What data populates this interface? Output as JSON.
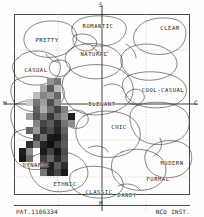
{
  "diagram": {
    "footer_left": "PAT.1106334",
    "footer_center": "H",
    "footer_right": "NCD INST."
  },
  "axes": {
    "top_label": "S",
    "bottom_label": "H",
    "left_label": "W",
    "right_label": "C",
    "x_range": [
      -2,
      2
    ],
    "y_range": [
      -2,
      2
    ],
    "grid": true,
    "grid_color": "#d8b9b9",
    "frame_color": "#4a4a4a"
  },
  "regions": [
    {
      "name": "romantic",
      "label": "ROMANTIC",
      "x": 98,
      "y": 26
    },
    {
      "name": "clear",
      "label": "CLEAR",
      "x": 170,
      "y": 28
    },
    {
      "name": "pretty",
      "label": "PRETTY",
      "x": 47,
      "y": 40
    },
    {
      "name": "natural",
      "label": "NATURAL",
      "x": 94,
      "y": 54
    },
    {
      "name": "casual",
      "label": "CASUAL",
      "x": 36,
      "y": 70
    },
    {
      "name": "cool-casual",
      "label": "COOL-CASUAL",
      "x": 163,
      "y": 90
    },
    {
      "name": "elegant",
      "label": "ELEGANT",
      "x": 102,
      "y": 104
    },
    {
      "name": "chic",
      "label": "CHIC",
      "x": 119,
      "y": 127
    },
    {
      "name": "modern",
      "label": "MODERN",
      "x": 172,
      "y": 163
    },
    {
      "name": "dynamic",
      "label": "DYNAMIC",
      "x": 36,
      "y": 165
    },
    {
      "name": "formal",
      "label": "FORMAL",
      "x": 158,
      "y": 179
    },
    {
      "name": "ethnic",
      "label": "ETHNIC",
      "x": 65,
      "y": 184
    },
    {
      "name": "classic",
      "label": "CLASSIC",
      "x": 99,
      "y": 192
    },
    {
      "name": "dandy",
      "label": "DANDY",
      "x": 127,
      "y": 195
    }
  ],
  "chart_data": {
    "type": "heatmap",
    "xlabel": "W — C",
    "ylabel": "S — H",
    "xlim": [
      -2,
      2
    ],
    "ylim": [
      -2,
      2
    ],
    "cell_size": 7,
    "note": "Grayscale cluster of plotted color samples over the image-scale map",
    "cells": [
      {
        "x": 47,
        "y": 78,
        "v": 0.58
      },
      {
        "x": 54,
        "y": 78,
        "v": 0.47
      },
      {
        "x": 40,
        "y": 85,
        "v": 0.66
      },
      {
        "x": 47,
        "y": 85,
        "v": 0.35
      },
      {
        "x": 54,
        "y": 85,
        "v": 0.72
      },
      {
        "x": 33,
        "y": 92,
        "v": 0.74
      },
      {
        "x": 40,
        "y": 92,
        "v": 0.52
      },
      {
        "x": 47,
        "y": 92,
        "v": 0.6
      },
      {
        "x": 54,
        "y": 92,
        "v": 0.4
      },
      {
        "x": 26,
        "y": 99,
        "v": 0.8
      },
      {
        "x": 33,
        "y": 99,
        "v": 0.45
      },
      {
        "x": 40,
        "y": 99,
        "v": 0.62
      },
      {
        "x": 47,
        "y": 99,
        "v": 0.3
      },
      {
        "x": 54,
        "y": 99,
        "v": 0.55
      },
      {
        "x": 33,
        "y": 106,
        "v": 0.38
      },
      {
        "x": 40,
        "y": 106,
        "v": 0.68
      },
      {
        "x": 47,
        "y": 106,
        "v": 0.44
      },
      {
        "x": 54,
        "y": 106,
        "v": 0.26
      },
      {
        "x": 61,
        "y": 106,
        "v": 0.5
      },
      {
        "x": 26,
        "y": 113,
        "v": 0.64
      },
      {
        "x": 33,
        "y": 113,
        "v": 0.33
      },
      {
        "x": 40,
        "y": 113,
        "v": 0.48
      },
      {
        "x": 47,
        "y": 113,
        "v": 0.22
      },
      {
        "x": 54,
        "y": 113,
        "v": 0.42
      },
      {
        "x": 61,
        "y": 113,
        "v": 0.58
      },
      {
        "x": 68,
        "y": 113,
        "v": 0.12
      },
      {
        "x": 33,
        "y": 120,
        "v": 0.52
      },
      {
        "x": 40,
        "y": 120,
        "v": 0.28
      },
      {
        "x": 47,
        "y": 120,
        "v": 0.36
      },
      {
        "x": 54,
        "y": 120,
        "v": 0.18
      },
      {
        "x": 61,
        "y": 120,
        "v": 0.46
      },
      {
        "x": 68,
        "y": 120,
        "v": 0.56
      },
      {
        "x": 26,
        "y": 127,
        "v": 0.4
      },
      {
        "x": 33,
        "y": 127,
        "v": 0.6
      },
      {
        "x": 40,
        "y": 127,
        "v": 0.2
      },
      {
        "x": 47,
        "y": 127,
        "v": 0.3
      },
      {
        "x": 54,
        "y": 127,
        "v": 0.15
      },
      {
        "x": 61,
        "y": 127,
        "v": 0.38
      },
      {
        "x": 33,
        "y": 134,
        "v": 0.25
      },
      {
        "x": 40,
        "y": 134,
        "v": 0.44
      },
      {
        "x": 47,
        "y": 134,
        "v": 0.1
      },
      {
        "x": 54,
        "y": 134,
        "v": 0.08
      },
      {
        "x": 61,
        "y": 134,
        "v": 0.32
      },
      {
        "x": 26,
        "y": 141,
        "v": 0.18
      },
      {
        "x": 33,
        "y": 141,
        "v": 0.48
      },
      {
        "x": 40,
        "y": 141,
        "v": 0.14
      },
      {
        "x": 47,
        "y": 141,
        "v": 0.06
      },
      {
        "x": 54,
        "y": 141,
        "v": 0.22
      },
      {
        "x": 61,
        "y": 141,
        "v": 0.35
      },
      {
        "x": 19,
        "y": 148,
        "v": 0.12
      },
      {
        "x": 26,
        "y": 148,
        "v": 0.55
      },
      {
        "x": 40,
        "y": 148,
        "v": 0.1
      },
      {
        "x": 47,
        "y": 148,
        "v": 0.26
      },
      {
        "x": 54,
        "y": 148,
        "v": 0.08
      },
      {
        "x": 61,
        "y": 148,
        "v": 0.3
      },
      {
        "x": 19,
        "y": 155,
        "v": 0.09
      },
      {
        "x": 26,
        "y": 155,
        "v": 0.42
      },
      {
        "x": 40,
        "y": 155,
        "v": 0.24
      },
      {
        "x": 47,
        "y": 155,
        "v": 0.4
      },
      {
        "x": 54,
        "y": 155,
        "v": 0.16
      },
      {
        "x": 61,
        "y": 155,
        "v": 0.34
      },
      {
        "x": 40,
        "y": 162,
        "v": 0.2
      },
      {
        "x": 47,
        "y": 162,
        "v": 0.12
      },
      {
        "x": 54,
        "y": 162,
        "v": 0.36
      },
      {
        "x": 61,
        "y": 162,
        "v": 0.18
      },
      {
        "x": 40,
        "y": 169,
        "v": 0.46
      },
      {
        "x": 47,
        "y": 169,
        "v": 0.14
      },
      {
        "x": 54,
        "y": 169,
        "v": 0.28
      },
      {
        "x": 61,
        "y": 169,
        "v": 0.1
      }
    ]
  }
}
